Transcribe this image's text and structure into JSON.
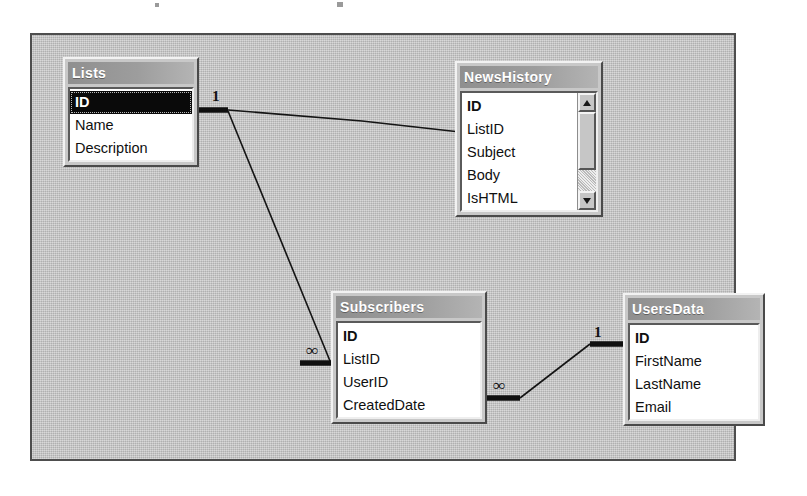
{
  "diagram": {
    "type": "database-relationships",
    "canvas_background": "#c3c3c3",
    "border_color": "#4e4e4e",
    "title_bar_color": "#9d9d9d",
    "selection_color": "#0a0a0a"
  },
  "tables": [
    {
      "id": "lists",
      "title": "Lists",
      "fields": [
        {
          "name": "ID",
          "primary_key": true,
          "selected": true
        },
        {
          "name": "Name",
          "primary_key": false,
          "selected": false
        },
        {
          "name": "Description",
          "primary_key": false,
          "selected": false
        }
      ],
      "has_scrollbar": false
    },
    {
      "id": "newshistory",
      "title": "NewsHistory",
      "fields": [
        {
          "name": "ID",
          "primary_key": true,
          "selected": false
        },
        {
          "name": "ListID",
          "primary_key": false,
          "selected": false
        },
        {
          "name": "Subject",
          "primary_key": false,
          "selected": false
        },
        {
          "name": "Body",
          "primary_key": false,
          "selected": false
        },
        {
          "name": "IsHTML",
          "primary_key": false,
          "selected": false
        }
      ],
      "has_scrollbar": true
    },
    {
      "id": "subscribers",
      "title": "Subscribers",
      "fields": [
        {
          "name": "ID",
          "primary_key": true,
          "selected": false
        },
        {
          "name": "ListID",
          "primary_key": false,
          "selected": false
        },
        {
          "name": "UserID",
          "primary_key": false,
          "selected": false
        },
        {
          "name": "CreatedDate",
          "primary_key": false,
          "selected": false
        }
      ],
      "has_scrollbar": false
    },
    {
      "id": "usersdata",
      "title": "UsersData",
      "fields": [
        {
          "name": "ID",
          "primary_key": true,
          "selected": false
        },
        {
          "name": "FirstName",
          "primary_key": false,
          "selected": false
        },
        {
          "name": "LastName",
          "primary_key": false,
          "selected": false
        },
        {
          "name": "Email",
          "primary_key": false,
          "selected": false
        }
      ],
      "has_scrollbar": false
    }
  ],
  "relationships": [
    {
      "id": "lists-newshistory",
      "from_table": "Lists",
      "from_field": "ID",
      "from_cardinality": "1",
      "to_table": "NewsHistory",
      "to_field": "ListID",
      "to_cardinality": "∞"
    },
    {
      "id": "lists-subscribers",
      "from_table": "Lists",
      "from_field": "ID",
      "from_cardinality": "1",
      "to_table": "Subscribers",
      "to_field": "ListID",
      "to_cardinality": "∞"
    },
    {
      "id": "subscribers-usersdata",
      "from_table": "Subscribers",
      "from_field": "UserID",
      "from_cardinality": "∞",
      "to_table": "UsersData",
      "to_field": "ID",
      "to_cardinality": "1"
    }
  ],
  "scrollbar": {
    "up_arrow": "▲",
    "down_arrow": "▼"
  }
}
